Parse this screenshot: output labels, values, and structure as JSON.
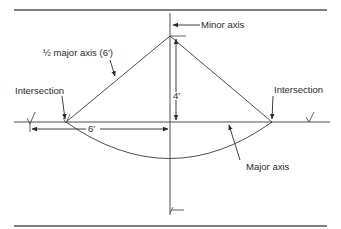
{
  "diagram": {
    "type": "ellipse layout construction",
    "labels": {
      "minor_axis": "Minor axis",
      "half_major_axis": "½ major axis (6′)",
      "intersection_left": "Intersection",
      "intersection_right": "Intersection",
      "major_axis": "Major axis",
      "dim_vertical": "4′",
      "dim_horizontal": "6′"
    },
    "colors": {
      "line": "#3a3a3a",
      "text": "#2a2a2a",
      "background": "#ffffff"
    },
    "dimensions": {
      "half_major_axis_ft": 6,
      "half_minor_axis_ft": 4
    }
  }
}
